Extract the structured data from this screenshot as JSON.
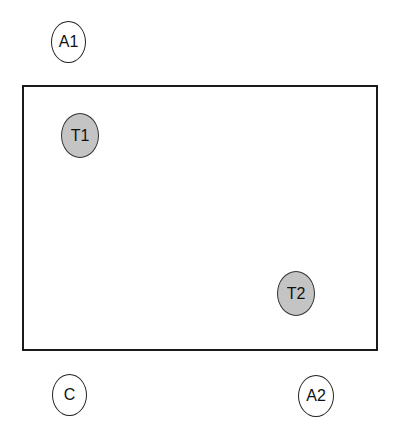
{
  "diagram": {
    "frame": {
      "stroke": "#1a1a1a",
      "fill": "#ffffff"
    },
    "nodes": [
      {
        "id": "A1",
        "label": "A1",
        "style": "outline",
        "position": "outside-top-left"
      },
      {
        "id": "T1",
        "label": "T1",
        "style": "filled",
        "fill": "#c4c4c4",
        "position": "inside-top-left"
      },
      {
        "id": "T2",
        "label": "T2",
        "style": "filled",
        "fill": "#c4c4c4",
        "position": "inside-bottom-right"
      },
      {
        "id": "C",
        "label": "C",
        "style": "outline",
        "position": "outside-bottom-left"
      },
      {
        "id": "A2",
        "label": "A2",
        "style": "outline",
        "position": "outside-bottom-right"
      }
    ]
  }
}
